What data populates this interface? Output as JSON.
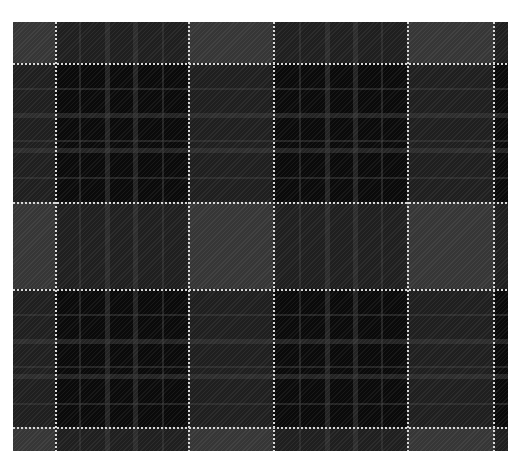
{
  "caption": {
    "text": ""
  },
  "fabric": {
    "origin": [
      13,
      22
    ],
    "size": [
      495,
      429
    ],
    "colors": {
      "dark": "#0a0a0a",
      "mid": "#1f1f1f",
      "light": "#363636",
      "stripe": "#3a3a3a",
      "overcheck": "#d8d8d8"
    },
    "light_cols": [
      [
        0,
        42
      ],
      [
        175,
        260
      ],
      [
        394,
        481
      ]
    ],
    "light_rows": [
      [
        0,
        41
      ],
      [
        180,
        267
      ],
      [
        405,
        429
      ]
    ],
    "white_v": [
      42,
      175,
      260,
      394,
      480
    ],
    "white_h": [
      41,
      180,
      267,
      405
    ],
    "grey_v": [
      [
        66,
        2
      ],
      [
        92,
        5
      ],
      [
        120,
        5
      ],
      [
        149,
        2
      ],
      [
        286,
        2
      ],
      [
        312,
        5
      ],
      [
        340,
        5
      ],
      [
        368,
        2
      ]
    ],
    "grey_h": [
      [
        66,
        2
      ],
      [
        91,
        5
      ],
      [
        118,
        2
      ],
      [
        126,
        5
      ],
      [
        155,
        2
      ],
      [
        292,
        2
      ],
      [
        317,
        5
      ],
      [
        344,
        2
      ],
      [
        352,
        5
      ],
      [
        381,
        2
      ]
    ]
  }
}
